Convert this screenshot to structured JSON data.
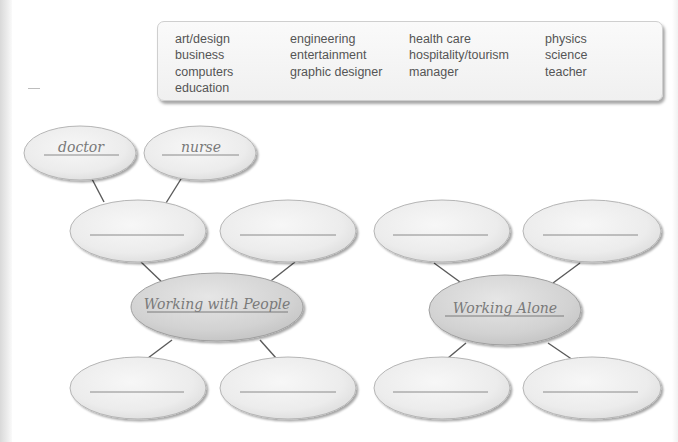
{
  "word_box": {
    "columns": [
      [
        "art/design",
        "business",
        "computers",
        "education"
      ],
      [
        "engineering",
        "entertainment",
        "graphic designer"
      ],
      [
        "health care",
        "hospitality/tourism",
        "manager"
      ],
      [
        "physics",
        "science",
        "teacher"
      ]
    ]
  },
  "diagram": {
    "colors": {
      "bubble_fill": "#ececec",
      "center_fill": "#d4d4d4",
      "line": "#5a5a5a",
      "text": "#7a7a7a"
    },
    "example_bubbles": {
      "left": "doctor",
      "right": "nurse"
    },
    "groups": [
      {
        "center_label": "Working with People",
        "branches": [
          "",
          "",
          "",
          ""
        ]
      },
      {
        "center_label": "Working Alone",
        "branches": [
          "",
          "",
          "",
          ""
        ]
      }
    ]
  }
}
